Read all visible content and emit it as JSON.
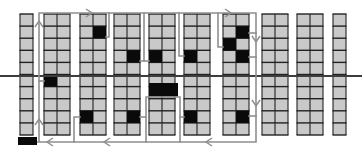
{
  "diagram": {
    "canvas": {
      "width": 362,
      "height": 153
    },
    "colors": {
      "background": "#ffffff",
      "rack_fill": "#c9c9c9",
      "grid_line": "#212121",
      "pick_fill": "#0a0a0a",
      "route": "#8f8f8f",
      "cross_aisle_line": "#3d3d3d",
      "depot_fill": "#0a0a0a"
    },
    "grid": {
      "rack_top": 14,
      "rack_bottom": 135,
      "rows": 10,
      "col_width": 13
    },
    "racks": [
      {
        "id": "A",
        "x": 20,
        "cols": 1
      },
      {
        "id": "B",
        "x": 44,
        "cols": 2
      },
      {
        "id": "C",
        "x": 80,
        "cols": 2
      },
      {
        "id": "D",
        "x": 114,
        "cols": 2
      },
      {
        "id": "E",
        "x": 149,
        "cols": 2
      },
      {
        "id": "F",
        "x": 184,
        "cols": 2
      },
      {
        "id": "G",
        "x": 223,
        "cols": 2
      },
      {
        "id": "H",
        "x": 262,
        "cols": 2
      },
      {
        "id": "I",
        "x": 297,
        "cols": 2
      },
      {
        "id": "J",
        "x": 333,
        "cols": 1
      }
    ],
    "picks": [
      {
        "rack": "B",
        "col": 0,
        "row": 6
      },
      {
        "rack": "C",
        "col": 1,
        "row": 2
      },
      {
        "rack": "C",
        "col": 0,
        "row": 9
      },
      {
        "rack": "D",
        "col": 1,
        "row": 4
      },
      {
        "rack": "D",
        "col": 1,
        "row": 9
      },
      {
        "rack": "E",
        "col": 0,
        "row": 4
      },
      {
        "rack": "F",
        "col": 0,
        "row": 4
      },
      {
        "rack": "F",
        "col": 0,
        "row": 9
      },
      {
        "rack": "G",
        "col": 1,
        "row": 2
      },
      {
        "rack": "G",
        "col": 0,
        "row": 3
      },
      {
        "rack": "G",
        "col": 1,
        "row": 4
      },
      {
        "rack": "G",
        "col": 1,
        "row": 9
      }
    ],
    "wide_pick": {
      "rack": "E",
      "cols": "both",
      "row": "6-7",
      "x": 149,
      "y": 83,
      "w": 29,
      "h": 13.5
    },
    "depot": {
      "x": 18,
      "y": 137,
      "w": 19,
      "h": 8
    },
    "cross_aisle_y": 76,
    "route_segments": [
      [
        [
          39,
          142
        ],
        [
          39,
          13
        ],
        [
          256,
          13
        ],
        [
          256,
          142
        ],
        [
          37,
          142
        ]
      ],
      [
        [
          109,
          13
        ],
        [
          109,
          37
        ],
        [
          106,
          37
        ]
      ],
      [
        [
          144,
          13
        ],
        [
          144,
          61
        ]
      ],
      [
        [
          140,
          61
        ],
        [
          149,
          61
        ]
      ],
      [
        [
          179,
          13
        ],
        [
          179,
          56
        ],
        [
          184,
          56
        ]
      ],
      [
        [
          218,
          13
        ],
        [
          218,
          47
        ],
        [
          223,
          47
        ]
      ],
      [
        [
          249,
          33
        ],
        [
          256,
          33
        ]
      ],
      [
        [
          249,
          57
        ],
        [
          256,
          57
        ]
      ],
      [
        [
          249,
          116
        ],
        [
          256,
          116
        ]
      ],
      [
        [
          146,
          142
        ],
        [
          146,
          97
        ],
        [
          180,
          97
        ],
        [
          180,
          142
        ]
      ],
      [
        [
          140,
          117
        ],
        [
          146,
          117
        ]
      ],
      [
        [
          180,
          117
        ],
        [
          184,
          117
        ]
      ],
      [
        [
          74,
          142
        ],
        [
          74,
          117
        ],
        [
          80,
          117
        ]
      ],
      [
        [
          39,
          81
        ],
        [
          44,
          81
        ]
      ]
    ],
    "arrows": [
      {
        "x": 39,
        "y": 22,
        "dir": "up"
      },
      {
        "x": 39,
        "y": 120,
        "dir": "up"
      },
      {
        "x": 91,
        "y": 13,
        "dir": "right"
      },
      {
        "x": 230,
        "y": 13,
        "dir": "right"
      },
      {
        "x": 256,
        "y": 41,
        "dir": "down"
      },
      {
        "x": 256,
        "y": 105,
        "dir": "down"
      },
      {
        "x": 207,
        "y": 142,
        "dir": "left"
      },
      {
        "x": 105,
        "y": 142,
        "dir": "left"
      },
      {
        "x": 48,
        "y": 142,
        "dir": "left"
      }
    ]
  }
}
